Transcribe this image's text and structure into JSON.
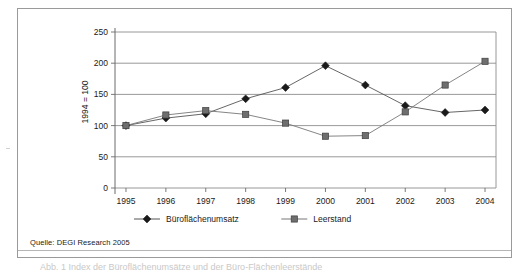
{
  "figure": {
    "source_note": "Quelle: DEGI Research 2005",
    "caption_partial": "Abb. 1   Index der Büroflächenumsätze und der Büro-Flächenleerstände"
  },
  "chart_data": {
    "type": "line",
    "title": "",
    "subtitle": "",
    "xlabel": "",
    "ylabel": "1994 = 100",
    "categories": [
      "1995",
      "1996",
      "1997",
      "1998",
      "1999",
      "2000",
      "2001",
      "2002",
      "2003",
      "2004"
    ],
    "x": [
      1995,
      1996,
      1997,
      1998,
      1999,
      2000,
      2001,
      2002,
      2003,
      2004
    ],
    "ylim": [
      0,
      250
    ],
    "yticks": [
      0,
      50,
      100,
      150,
      200,
      250
    ],
    "ytick_labels": [
      "0",
      "50",
      "100",
      "150",
      "200",
      "250"
    ],
    "grid": true,
    "grid_axis": "y",
    "legend_position": "bottom",
    "series": [
      {
        "name": "Büroflächenumsatz",
        "marker": "diamond",
        "color": "#1a1a1a",
        "line_color": "#555555",
        "values": [
          100,
          112,
          119,
          143,
          161,
          196,
          165,
          132,
          121,
          125
        ]
      },
      {
        "name": "Leerstand",
        "marker": "square",
        "color": "#6e6e6e",
        "line_color": "#777777",
        "values": [
          100,
          117,
          124,
          118,
          104,
          83,
          84,
          122,
          165,
          203
        ]
      }
    ]
  },
  "colors": {
    "frame_border": "#9a9a9a",
    "gridline": "#8d8d8d",
    "axis": "#6b6b6b",
    "background": "#ffffff",
    "series_1": "#1a1a1a",
    "series_2": "#6e6e6e"
  }
}
